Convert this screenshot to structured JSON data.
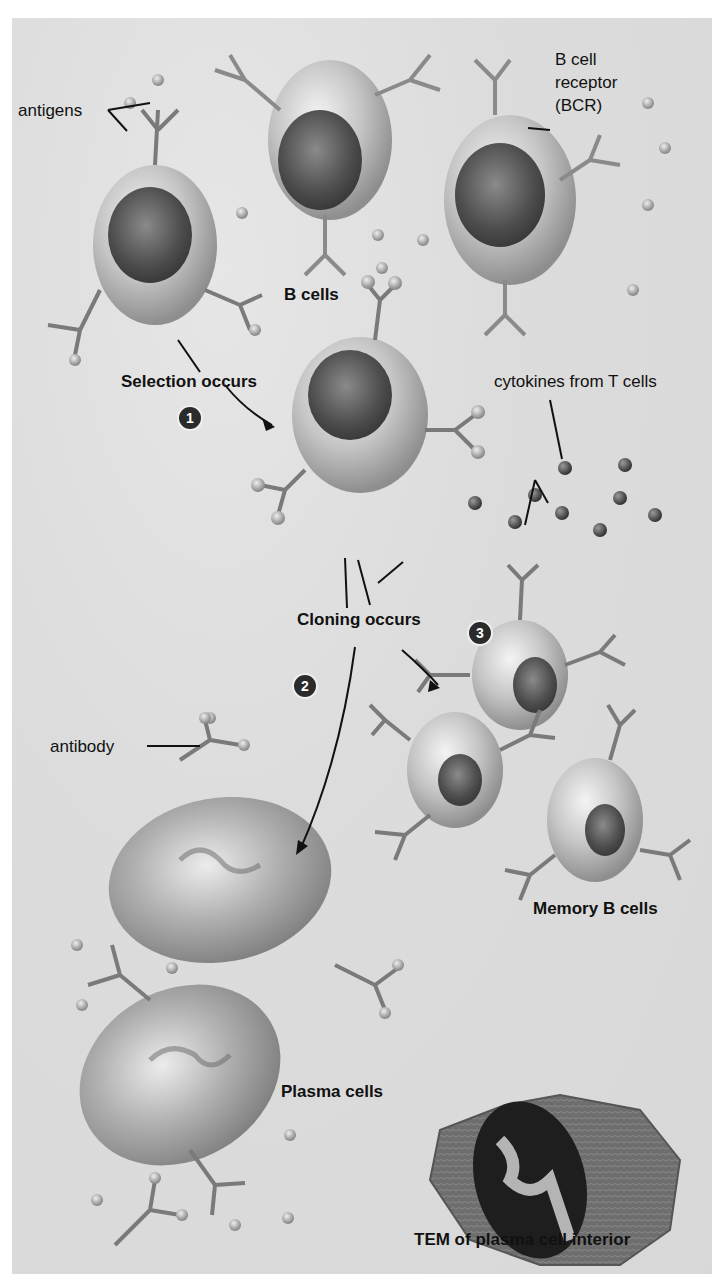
{
  "figure": {
    "labels": {
      "antigens": "antigens",
      "bcr": [
        "B cell",
        "receptor",
        "(BCR)"
      ],
      "b_cells": "B cells",
      "selection": "Selection occurs",
      "cytokines": "cytokines from T cells",
      "cloning": "Cloning occurs",
      "antibody": "antibody",
      "memory": "Memory B cells",
      "plasma": "Plasma cells",
      "tem": "TEM of plasma cell interior"
    },
    "steps": [
      "1",
      "2",
      "3"
    ],
    "colors": {
      "background": "#dcdcdc",
      "cell": "#b8b8b8",
      "nucleus": "#555555",
      "receptor": "#7a7a7a",
      "cytokine": "#4a4a4a",
      "text": "#111111"
    }
  }
}
